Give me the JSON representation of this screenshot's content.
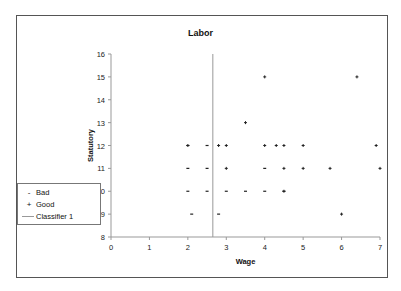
{
  "chart_data": {
    "type": "scatter",
    "title": "Labor",
    "xlabel": "Wage",
    "ylabel": "Statutory",
    "xlim": [
      0,
      7
    ],
    "ylim": [
      8,
      16
    ],
    "x_ticks": [
      "0",
      "1",
      "2",
      "3",
      "4",
      "5",
      "6",
      "7"
    ],
    "y_ticks": [
      "8",
      "9",
      "10",
      "11",
      "12",
      "13",
      "14",
      "15",
      "16"
    ],
    "grid": false,
    "legend_position": "left",
    "legend": [
      "Bad",
      "Good",
      "Classifier 1"
    ],
    "series": [
      {
        "name": "Bad",
        "marker": "dash",
        "points": [
          [
            2,
            12
          ],
          [
            2,
            11
          ],
          [
            2,
            10
          ],
          [
            2.5,
            11
          ],
          [
            2.5,
            10
          ],
          [
            2.1,
            9
          ],
          [
            2.8,
            9
          ],
          [
            3,
            10
          ],
          [
            3.5,
            10
          ],
          [
            4,
            10
          ],
          [
            4,
            11
          ],
          [
            4.5,
            10
          ],
          [
            2.5,
            12
          ]
        ]
      },
      {
        "name": "Good",
        "marker": "plus",
        "points": [
          [
            2,
            12
          ],
          [
            2.8,
            12
          ],
          [
            3,
            12
          ],
          [
            3,
            11
          ],
          [
            3.5,
            13
          ],
          [
            4,
            15
          ],
          [
            4,
            12
          ],
          [
            4.3,
            12
          ],
          [
            4.5,
            12
          ],
          [
            4.5,
            11
          ],
          [
            5,
            12
          ],
          [
            5,
            11
          ],
          [
            5.7,
            11
          ],
          [
            6,
            9
          ],
          [
            6.4,
            15
          ],
          [
            6.9,
            12
          ],
          [
            7,
            11
          ],
          [
            4.5,
            10
          ]
        ]
      }
    ],
    "classifier": {
      "name": "Classifier 1",
      "type": "vertical_line",
      "x": 2.65
    }
  },
  "legend": {
    "items": [
      {
        "label": "Bad",
        "symbol": "-"
      },
      {
        "label": "Good",
        "symbol": "+"
      },
      {
        "label": "Classifier 1",
        "symbol": "line"
      }
    ]
  }
}
